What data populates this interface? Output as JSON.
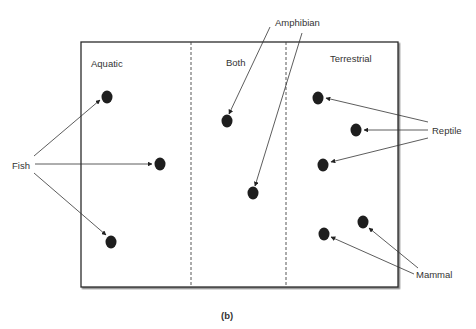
{
  "figure": {
    "caption": "(b)",
    "box": {
      "x": 81,
      "y": 42,
      "width": 317,
      "height": 245,
      "stroke": "#2a2a2a"
    },
    "dividers": [
      191,
      286
    ],
    "zones": [
      {
        "label": "Aquatic",
        "x": 91,
        "y": 67
      },
      {
        "label": "Both",
        "x": 226,
        "y": 66
      },
      {
        "label": "Terrestrial",
        "x": 330,
        "y": 62
      }
    ],
    "dot_color": "#1e1e1e",
    "dots": [
      {
        "id": "fish-1",
        "cx": 107,
        "cy": 97,
        "zone": "Aquatic",
        "group": "Fish"
      },
      {
        "id": "fish-2",
        "cx": 160,
        "cy": 164,
        "zone": "Aquatic",
        "group": "Fish"
      },
      {
        "id": "fish-3",
        "cx": 111,
        "cy": 242,
        "zone": "Aquatic",
        "group": "Fish"
      },
      {
        "id": "amphibian-1",
        "cx": 227,
        "cy": 121,
        "zone": "Both",
        "group": "Amphibian"
      },
      {
        "id": "amphibian-2",
        "cx": 253,
        "cy": 193,
        "zone": "Both",
        "group": "Amphibian"
      },
      {
        "id": "reptile-1",
        "cx": 318,
        "cy": 98,
        "zone": "Terrestrial",
        "group": "Reptile"
      },
      {
        "id": "reptile-2",
        "cx": 356,
        "cy": 130,
        "zone": "Terrestrial",
        "group": "Reptile"
      },
      {
        "id": "reptile-3",
        "cx": 323,
        "cy": 165,
        "zone": "Terrestrial",
        "group": "Reptile"
      },
      {
        "id": "mammal-1",
        "cx": 363,
        "cy": 222,
        "zone": "Terrestrial",
        "group": "Mammal"
      },
      {
        "id": "mammal-2",
        "cx": 324,
        "cy": 234,
        "zone": "Terrestrial",
        "group": "Mammal"
      }
    ],
    "callouts": [
      {
        "label": "Fish",
        "x": 12,
        "y": 169,
        "arrows": [
          {
            "x1": 34,
            "y1": 156,
            "x2": 100,
            "y2": 100
          },
          {
            "x1": 35,
            "y1": 164,
            "x2": 152,
            "y2": 164
          },
          {
            "x1": 34,
            "y1": 173,
            "x2": 106,
            "y2": 235
          }
        ]
      },
      {
        "label": "Amphibian",
        "x": 275,
        "y": 26,
        "arrows": [
          {
            "x1": 270,
            "y1": 27,
            "x2": 229,
            "y2": 114
          },
          {
            "x1": 302,
            "y1": 33,
            "x2": 255,
            "y2": 186
          }
        ]
      },
      {
        "label": "Reptile",
        "x": 432,
        "y": 134,
        "arrows": [
          {
            "x1": 428,
            "y1": 122,
            "x2": 326,
            "y2": 98
          },
          {
            "x1": 428,
            "y1": 130,
            "x2": 364,
            "y2": 130
          },
          {
            "x1": 428,
            "y1": 138,
            "x2": 331,
            "y2": 162
          }
        ]
      },
      {
        "label": "Mammal",
        "x": 416,
        "y": 278,
        "arrows": [
          {
            "x1": 418,
            "y1": 268,
            "x2": 369,
            "y2": 228
          },
          {
            "x1": 414,
            "y1": 274,
            "x2": 331,
            "y2": 237
          }
        ]
      }
    ]
  }
}
